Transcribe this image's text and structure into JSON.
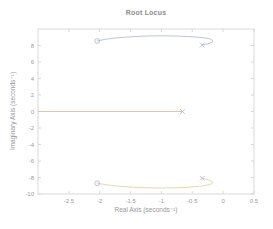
{
  "window": {
    "background": "#ffffff"
  },
  "chart_data": {
    "type": "line",
    "plot_kind": "root-locus",
    "title": "Root Locus",
    "xlabel": "Real Axis (seconds⁻¹)",
    "ylabel": "Imaginary Axis (seconds⁻¹)",
    "xlim": [
      -3,
      0.5
    ],
    "ylim": [
      -10,
      10
    ],
    "xticks": [
      -2.5,
      -2,
      -1.5,
      -1,
      -0.5,
      0,
      0.5
    ],
    "xtick_labels": [
      "-2.5",
      "-2",
      "-1.5",
      "-1",
      "-0.5",
      "0",
      "0.5"
    ],
    "yticks": [
      8,
      6,
      4,
      2,
      0,
      -2,
      -4,
      -6,
      -8,
      -10
    ],
    "ytick_labels": [
      "8",
      "6",
      "4",
      "2",
      "0",
      "-2",
      "-4",
      "-6",
      "-8",
      "-10"
    ],
    "grid": false,
    "legend": null,
    "box": true,
    "poles": [
      [
        -0.34,
        8.05
      ],
      [
        -0.66,
        0
      ],
      [
        -0.34,
        -8.1
      ]
    ],
    "zeros": [
      [
        -2.04,
        8.55
      ],
      [
        -2.04,
        -8.7
      ]
    ],
    "branches": [
      {
        "name": "branch-upper",
        "color": "#b9c5df",
        "points": [
          [
            -0.34,
            8.05
          ],
          [
            -0.2,
            8.25
          ],
          [
            -0.15,
            8.6
          ],
          [
            -0.25,
            8.9
          ],
          [
            -0.55,
            9.1
          ],
          [
            -1.0,
            9.2
          ],
          [
            -1.45,
            9.1
          ],
          [
            -1.85,
            8.85
          ],
          [
            -2.04,
            8.55
          ]
        ]
      },
      {
        "name": "branch-real-axis",
        "color": "#eac3a1",
        "points": [
          [
            -0.66,
            0
          ],
          [
            -3,
            0
          ]
        ]
      },
      {
        "name": "branch-lower",
        "color": "#e6d9ab",
        "points": [
          [
            -0.34,
            -8.1
          ],
          [
            -0.2,
            -8.35
          ],
          [
            -0.15,
            -8.65
          ],
          [
            -0.25,
            -8.95
          ],
          [
            -0.55,
            -9.2
          ],
          [
            -1.0,
            -9.3
          ],
          [
            -1.45,
            -9.2
          ],
          [
            -1.85,
            -8.95
          ],
          [
            -2.04,
            -8.7
          ]
        ]
      }
    ],
    "colors": {
      "axis": "#d9d9d9",
      "tick_text": "#9b9b9b",
      "title_text": "#8c8c8c",
      "label_text": "#979797",
      "marker": "#b4bcc8"
    }
  }
}
